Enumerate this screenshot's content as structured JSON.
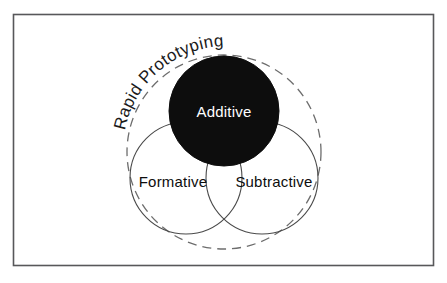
{
  "figure": {
    "title": "Rapid Prototyping",
    "type": "venn-diagram",
    "border": {
      "visible": true,
      "color": "#58585a",
      "x": 13,
      "y": 14,
      "width": 421,
      "height": 252
    },
    "background_color": "#ffffff"
  },
  "outer_set": {
    "label": "Rapid Prototyping",
    "style": "dashed",
    "stroke_color": "#6d6d6d",
    "fill": "none",
    "cx": 224,
    "cy": 152,
    "r": 97
  },
  "sets": [
    {
      "label": "Additive",
      "fill_color": "#0d0d0d",
      "stroke_color": "#0d0d0d",
      "text_color": "#ffffff",
      "cx": 224,
      "cy": 111,
      "r": 55,
      "label_x": 224,
      "label_y": 114
    },
    {
      "label": "Formative",
      "fill_color": "none",
      "stroke_color": "#4a4a4a",
      "text_color": "#0d0d0d",
      "cx": 186,
      "cy": 178,
      "r": 56,
      "label_x": 173,
      "label_y": 184
    },
    {
      "label": "Subtractive",
      "fill_color": "none",
      "stroke_color": "#4a4a4a",
      "text_color": "#0d0d0d",
      "cx": 262,
      "cy": 178,
      "r": 56,
      "label_x": 273,
      "label_y": 184
    }
  ],
  "title_arc": {
    "text": "Rapid Prototyping",
    "path_start_x": 123,
    "path_start_y": 150,
    "path_radius": 104,
    "start_offset_percent": "6%"
  }
}
